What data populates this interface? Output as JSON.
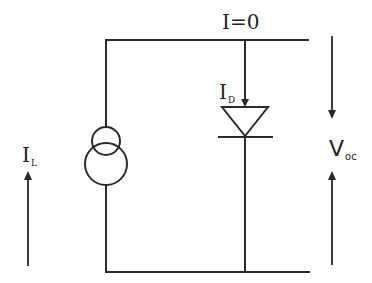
{
  "diagram": {
    "stroke_color": "#2a2a2a",
    "background_color": "#ffffff",
    "labels": {
      "top_current": "I=0",
      "diode_current": {
        "main": "I",
        "sub": "D"
      },
      "source_current": {
        "main": "I",
        "sub": "L"
      },
      "open_circuit_voltage": {
        "main": "V",
        "sub": "oc"
      }
    },
    "components": [
      {
        "type": "current-source",
        "symbol": "two-overlapping-circles",
        "label": "I_L"
      },
      {
        "type": "diode",
        "orientation": "pointing-down",
        "label": "I_D"
      }
    ],
    "arrows": [
      {
        "name": "source-current-arrow",
        "direction": "up",
        "label": "I_L"
      },
      {
        "name": "voltage-arrow-top",
        "direction": "down",
        "label": "V_oc"
      },
      {
        "name": "voltage-arrow-bottom",
        "direction": "up",
        "label": "V_oc"
      },
      {
        "name": "diode-current-arrow",
        "direction": "down",
        "label": "I_D"
      }
    ]
  }
}
